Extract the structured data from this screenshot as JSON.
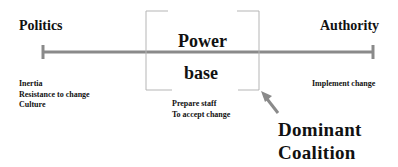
{
  "diagram": {
    "left_pole": "Politics",
    "right_pole": "Authority",
    "center": {
      "line1": "Power",
      "line2": "base"
    },
    "left_notes": [
      "Inertia",
      "Resistance to change",
      "Culture"
    ],
    "center_notes": [
      "Prepare staff",
      "To accept change"
    ],
    "right_notes": [
      "Implement change"
    ],
    "callout": {
      "line1": "Dominant",
      "line2": "Coalition"
    },
    "colors": {
      "axis_line": "#8a8a8a",
      "bracket": "#b5b5b5",
      "arrow": "#8a8a8a",
      "text": "#111111"
    }
  }
}
